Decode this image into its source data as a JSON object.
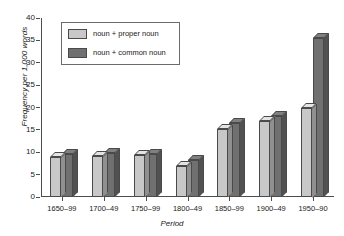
{
  "chart_data": {
    "type": "bar",
    "title": "",
    "xlabel": "Period",
    "ylabel": "Frequency per 1,000 words",
    "ylim": [
      0,
      40
    ],
    "yticks": [
      0,
      5,
      10,
      15,
      20,
      25,
      30,
      35,
      40
    ],
    "grid": false,
    "legend_position": "upper-left-inside",
    "categories": [
      "1650–99",
      "1700–49",
      "1750–99",
      "1800–49",
      "1850–99",
      "1900–49",
      "1950–90"
    ],
    "series": [
      {
        "name": "noun + proper noun",
        "color": "#c8c8c8",
        "values": [
          9,
          9.2,
          9.3,
          7,
          15.2,
          17,
          20
        ]
      },
      {
        "name": "noun + common noun",
        "color": "#707070",
        "values": [
          9.6,
          9.8,
          9.6,
          8.2,
          16.5,
          18,
          35.5
        ]
      }
    ]
  },
  "legend": {
    "items": [
      {
        "label": "noun + proper noun"
      },
      {
        "label": "noun + common noun"
      }
    ]
  },
  "colors": {
    "series_light": "#c8c8c8",
    "series_dark": "#707070",
    "axis": "#4d4d4d",
    "outline": "#4a4a4a",
    "background": "#ffffff"
  }
}
